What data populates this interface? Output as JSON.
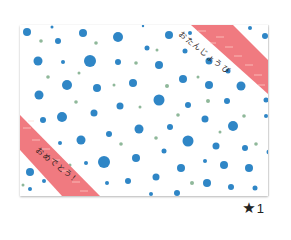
{
  "card": {
    "background": "#ffffff",
    "dot_colors": {
      "blue": "#2f86c6",
      "green": "#8fb89a"
    },
    "ribbon_color": "#f07a80",
    "ribbon_top_right_text": "おたんじょうび",
    "ribbon_bottom_left_text": "おめでとう！"
  },
  "rating": {
    "icon": "star-icon",
    "count": "1"
  }
}
